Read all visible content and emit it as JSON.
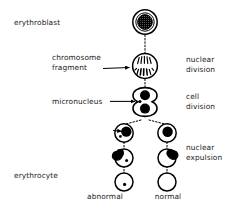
{
  "figure": {
    "title_visible": false,
    "background_color": "#ffffff",
    "ink_color": "#000000",
    "labels_left": [
      {
        "id": "erythroblast",
        "text": "erythroblast",
        "x": 14,
        "y": 25
      },
      {
        "id": "chromosome-fragment-line1",
        "text": "chromosome",
        "x": 55,
        "y": 59
      },
      {
        "id": "chromosome-fragment-line2",
        "text": "fragment",
        "x": 55,
        "y": 69
      },
      {
        "id": "micronucleus",
        "text": "micronucleus",
        "x": 55,
        "y": 100
      },
      {
        "id": "erythrocyte",
        "text": "erythrocyte",
        "x": 14,
        "y": 176
      }
    ],
    "labels_right": [
      {
        "id": "nuclear-division-line1",
        "text": "nuclear",
        "x": 185,
        "y": 59
      },
      {
        "id": "nuclear-division-line2",
        "text": "division",
        "x": 185,
        "y": 69
      },
      {
        "id": "cell-division-line1",
        "text": "cell",
        "x": 185,
        "y": 96
      },
      {
        "id": "cell-division-line2",
        "text": "division",
        "x": 185,
        "y": 106
      },
      {
        "id": "nuclear-expulsion-line1",
        "text": "nuclear",
        "x": 185,
        "y": 145
      },
      {
        "id": "nuclear-expulsion-line2",
        "text": "expulsion",
        "x": 185,
        "y": 155
      }
    ],
    "labels_bottom": [
      {
        "id": "abnormal",
        "text": "abnormal",
        "x": 100,
        "y": 198
      },
      {
        "id": "normal",
        "text": "normal",
        "x": 158,
        "y": 198
      }
    ],
    "stages": [
      {
        "id": "stage-erythroblast",
        "name": "erythroblast",
        "cx": 145,
        "cy": 22,
        "r": 12,
        "nucleus": {
          "type": "stippled-dark",
          "cx": 145,
          "cy": 22,
          "r": 7.6
        }
      },
      {
        "id": "stage-nuclear-division",
        "name": "nuclear division cell with chromosome fragment",
        "cx": 145,
        "cy": 66,
        "r": 12,
        "nucleus": {
          "type": "chromosome-spindle"
        }
      },
      {
        "id": "stage-cell-division",
        "name": "cell division doublet with micronucleus",
        "cx": 145,
        "cy": 103,
        "nucleus": {
          "type": "two-dark-nuclei-with-micronucleus"
        }
      },
      {
        "id": "stage-daughter-abnormal",
        "name": "abnormal daughter cell",
        "cx": 124,
        "cy": 133,
        "r": 9,
        "nucleus": {
          "type": "dark-nucleus-with-micronucleus"
        }
      },
      {
        "id": "stage-daughter-normal",
        "name": "normal daughter cell",
        "cx": 167,
        "cy": 133,
        "r": 9,
        "nucleus": {
          "type": "dark-nucleus"
        }
      },
      {
        "id": "stage-expulsion-abnormal",
        "name": "abnormal nuclear expulsion",
        "cx": 124,
        "cy": 157,
        "r": 9,
        "nucleus": {
          "type": "expelled-nucleus-left-with-micronucleus"
        }
      },
      {
        "id": "stage-expulsion-normal",
        "name": "normal nuclear expulsion",
        "cx": 167,
        "cy": 157,
        "r": 9,
        "nucleus": {
          "type": "expelled-nucleus-right"
        }
      },
      {
        "id": "stage-erythrocyte-abnormal",
        "name": "abnormal erythrocyte",
        "cx": 124,
        "cy": 182,
        "r": 9,
        "nucleus": {
          "type": "micronucleus-dot"
        }
      },
      {
        "id": "stage-erythrocyte-normal",
        "name": "normal erythrocyte",
        "cx": 167,
        "cy": 182,
        "r": 9,
        "nucleus": {
          "type": "none"
        }
      }
    ],
    "pointer_arrows": [
      {
        "id": "arrow-chromosome-fragment",
        "from_x": 103,
        "from_y": 67,
        "to_x": 131,
        "to_y": 67
      },
      {
        "id": "arrow-micronucleus",
        "from_x": 110,
        "from_y": 101,
        "to_x": 136,
        "to_y": 101
      },
      {
        "id": "arrow-micronucleus-daughter",
        "from_x": 112,
        "from_y": 130,
        "to_x": 121,
        "to_y": 130
      }
    ]
  }
}
